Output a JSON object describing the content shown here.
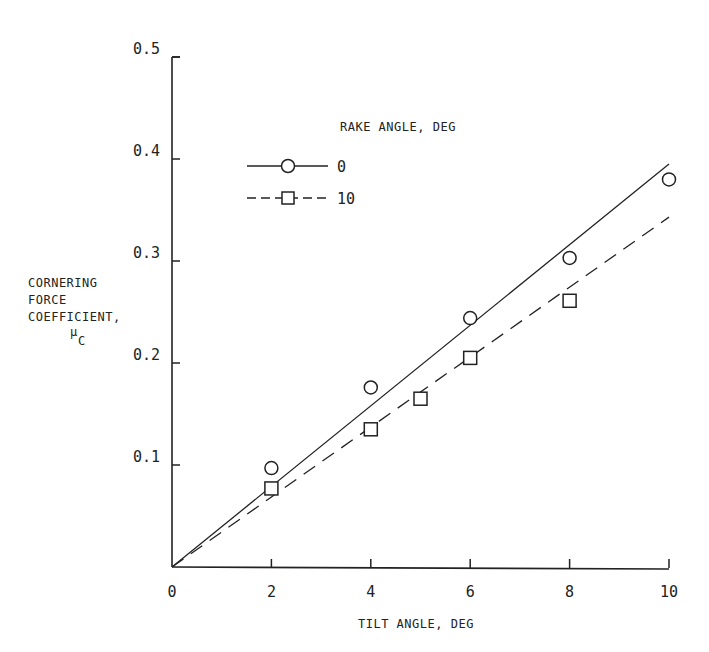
{
  "chart_data": {
    "type": "scatter",
    "title": "",
    "xlabel": "TILT ANGLE, DEG",
    "ylabel_lines": [
      "CORNERING",
      "FORCE",
      "COEFFICIENT,"
    ],
    "ylabel_symbol": "μ",
    "ylabel_subscript": "C",
    "xlim": [
      0,
      10
    ],
    "ylim": [
      0,
      0.5
    ],
    "x_ticks": [
      0,
      2,
      4,
      6,
      8,
      10
    ],
    "x_tick_labels": [
      "0",
      "2",
      "4",
      "6",
      "8",
      "10"
    ],
    "y_ticks": [
      0.1,
      0.2,
      0.3,
      0.4,
      0.5
    ],
    "y_tick_labels": [
      "0.1",
      "0.2",
      "0.3",
      "0.4",
      "0.5"
    ],
    "grid": false,
    "legend": {
      "title": "RAKE ANGLE, DEG",
      "placement": "top-left",
      "entries": [
        "0",
        "10"
      ]
    },
    "series": [
      {
        "name": "0",
        "marker": "circle",
        "line_style": "solid",
        "points": [
          [
            2,
            0.097
          ],
          [
            4,
            0.176
          ],
          [
            6,
            0.244
          ],
          [
            8,
            0.303
          ],
          [
            10,
            0.38
          ]
        ],
        "fit_line": [
          [
            0,
            0
          ],
          [
            10,
            0.395
          ]
        ]
      },
      {
        "name": "10",
        "marker": "square",
        "line_style": "dashed",
        "points": [
          [
            2,
            0.077
          ],
          [
            4,
            0.135
          ],
          [
            5,
            0.165
          ],
          [
            6,
            0.205
          ],
          [
            8,
            0.261
          ]
        ],
        "fit_line": [
          [
            0,
            0
          ],
          [
            10,
            0.343
          ]
        ]
      }
    ]
  }
}
